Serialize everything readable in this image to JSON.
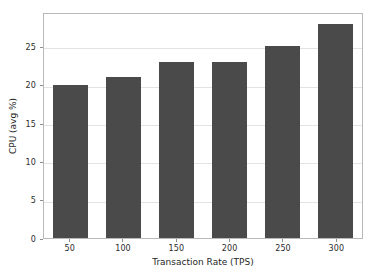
{
  "chart_data": {
    "type": "bar",
    "title": "",
    "categories": [
      "50",
      "100",
      "150",
      "200",
      "250",
      "300"
    ],
    "values": [
      20,
      21,
      23,
      23,
      25,
      28
    ],
    "series": [
      {
        "name": "CPU (avg %)",
        "values": [
          20,
          21,
          23,
          23,
          25,
          28
        ]
      }
    ],
    "xlabel": "Transaction Rate (TPS)",
    "ylabel": "CPU (avg %)",
    "ylim": [
      0,
      29.5
    ],
    "yticks": [
      0,
      5,
      10,
      15,
      20,
      25
    ],
    "ytick_labels": [
      "0",
      "5",
      "10",
      "15",
      "20",
      "25"
    ],
    "xtick_labels": [
      "50",
      "100",
      "150",
      "200",
      "250",
      "300"
    ],
    "grid": "horizontal",
    "legend": "none",
    "bar_color": "#4a4a4a",
    "grid_color": "#e3e3e3",
    "axes_color": "#b9b9b9",
    "background_color": "#ffffff"
  }
}
